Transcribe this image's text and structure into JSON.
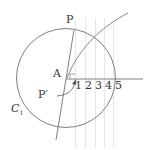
{
  "figure": {
    "labels": {
      "P": "P",
      "A": "A",
      "P_prime": "P′",
      "C": "C",
      "C_sub": "1"
    },
    "ticks": [
      "1",
      "2",
      "3",
      "4",
      "5"
    ],
    "colors": {
      "stroke": "#777777",
      "grid": "#e4e4e4",
      "text": "#333333"
    }
  }
}
